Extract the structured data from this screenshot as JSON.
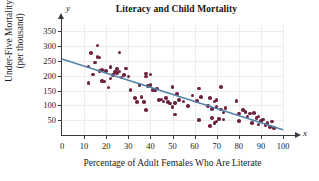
{
  "chart_data": {
    "type": "scatter",
    "title": "Literacy and Child Mortality",
    "xlabel": "Percentage of Adult Females Who Are Literate",
    "ylabel_line1": "Under-Five Mortality",
    "ylabel_line2": "(per thousand)",
    "x_axis_variable": "x",
    "y_axis_variable": "y",
    "xlim": [
      0,
      100
    ],
    "ylim": [
      0,
      375
    ],
    "xticks": [
      0,
      10,
      20,
      30,
      40,
      50,
      60,
      70,
      80,
      90,
      100
    ],
    "yticks": [
      50,
      100,
      150,
      200,
      250,
      300,
      350
    ],
    "grid": true,
    "legend": "none",
    "marker_color": "#6e2240",
    "trendline_color": "#5383a8",
    "trendline": {
      "type": "line",
      "label": "least-squares regression line",
      "x_start": 0,
      "y_start": 257,
      "x_end": 100,
      "y_end": 18
    },
    "points": [
      [
        12,
        176
      ],
      [
        12,
        231
      ],
      [
        13,
        278
      ],
      [
        14,
        204
      ],
      [
        15,
        245
      ],
      [
        16,
        302
      ],
      [
        16,
        264
      ],
      [
        17,
        216
      ],
      [
        17,
        262
      ],
      [
        18,
        219
      ],
      [
        18,
        182
      ],
      [
        19,
        181
      ],
      [
        20,
        217
      ],
      [
        21,
        161
      ],
      [
        22,
        230
      ],
      [
        22,
        191
      ],
      [
        23,
        202
      ],
      [
        24,
        213
      ],
      [
        25,
        209
      ],
      [
        25,
        222
      ],
      [
        26,
        279
      ],
      [
        26,
        214
      ],
      [
        27,
        194
      ],
      [
        28,
        203
      ],
      [
        29,
        224
      ],
      [
        30,
        197
      ],
      [
        31,
        152
      ],
      [
        33,
        124
      ],
      [
        34,
        112
      ],
      [
        35,
        169
      ],
      [
        36,
        128
      ],
      [
        37,
        111
      ],
      [
        38,
        85
      ],
      [
        38,
        208
      ],
      [
        38,
        198
      ],
      [
        39,
        166
      ],
      [
        40,
        205
      ],
      [
        40,
        168
      ],
      [
        41,
        152
      ],
      [
        42,
        150
      ],
      [
        43,
        157
      ],
      [
        44,
        118
      ],
      [
        45,
        120
      ],
      [
        46,
        113
      ],
      [
        47,
        124
      ],
      [
        48,
        111
      ],
      [
        49,
        107
      ],
      [
        50,
        163
      ],
      [
        50,
        94
      ],
      [
        51,
        69
      ],
      [
        51,
        109
      ],
      [
        52,
        139
      ],
      [
        53,
        118
      ],
      [
        55,
        113
      ],
      [
        57,
        98
      ],
      [
        59,
        133
      ],
      [
        61,
        114
      ],
      [
        62,
        50
      ],
      [
        62,
        157
      ],
      [
        63,
        129
      ],
      [
        66,
        98
      ],
      [
        67,
        30
      ],
      [
        67,
        124
      ],
      [
        68,
        57
      ],
      [
        68,
        88
      ],
      [
        69,
        40
      ],
      [
        69,
        113
      ],
      [
        70,
        46
      ],
      [
        70,
        95
      ],
      [
        70,
        119
      ],
      [
        71,
        54
      ],
      [
        72,
        86
      ],
      [
        72,
        162
      ],
      [
        73,
        52
      ],
      [
        73,
        76
      ],
      [
        74,
        91
      ],
      [
        79,
        114
      ],
      [
        80,
        72
      ],
      [
        80,
        47
      ],
      [
        82,
        84
      ],
      [
        83,
        77
      ],
      [
        84,
        63
      ],
      [
        85,
        72
      ],
      [
        86,
        41
      ],
      [
        87,
        74
      ],
      [
        88,
        58
      ],
      [
        89,
        62
      ],
      [
        89,
        36
      ],
      [
        90,
        48
      ],
      [
        91,
        52
      ],
      [
        92,
        34
      ],
      [
        93,
        41
      ],
      [
        94,
        27
      ],
      [
        95,
        46
      ],
      [
        96,
        23
      ]
    ]
  }
}
